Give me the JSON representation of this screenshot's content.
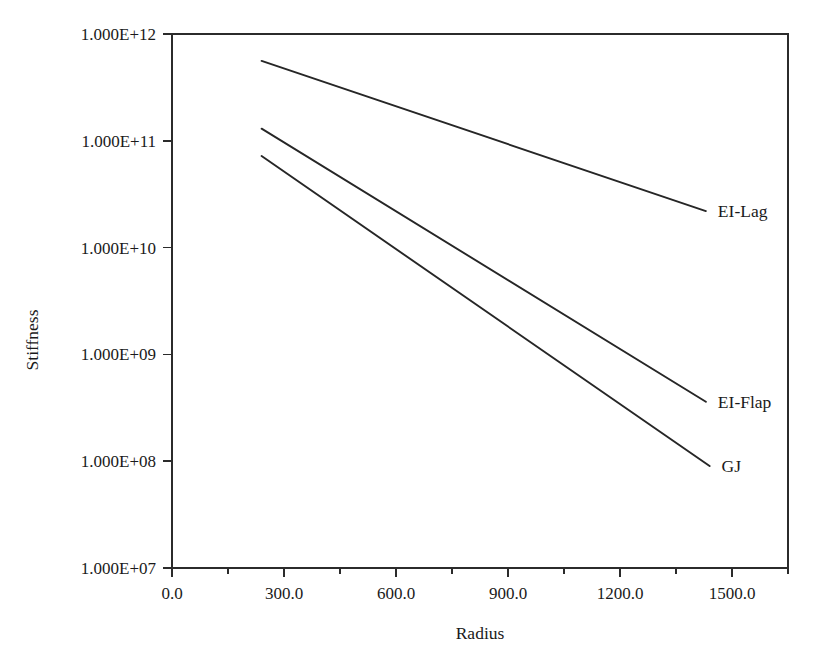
{
  "chart_data": {
    "type": "line",
    "title": "",
    "xlabel": "Radius",
    "ylabel": "Stiffness",
    "xlim": [
      0.0,
      1650.0
    ],
    "ylim": [
      10000000,
      1000000000000
    ],
    "yscale": "log",
    "xscale": "linear",
    "grid": false,
    "legend_position": "inline-right-of-line-ends",
    "x_ticks": [
      "0.0",
      "300.0",
      "600.0",
      "900.0",
      "1200.0",
      "1500.0"
    ],
    "x_tick_values": [
      0,
      300,
      600,
      900,
      1200,
      1500
    ],
    "x_minor_tick_values": [
      150,
      450,
      750,
      1050,
      1350,
      1650
    ],
    "y_ticks": [
      "1.000E+07",
      "1.000E+08",
      "1.000E+09",
      "1.000E+10",
      "1.000E+11",
      "1.000E+12"
    ],
    "y_tick_values": [
      10000000,
      100000000,
      1000000000,
      10000000000,
      100000000000,
      1000000000000
    ],
    "series": [
      {
        "name": "EI-Lag",
        "color": "#262626",
        "x": [
          240,
          1430
        ],
        "y": [
          560000000000.0,
          22000000000.0
        ],
        "label": "EI-Lag"
      },
      {
        "name": "EI-Flap",
        "color": "#262626",
        "x": [
          240,
          1430
        ],
        "y": [
          130000000000.0,
          360000000.0
        ],
        "label": "EI-Flap"
      },
      {
        "name": "GJ",
        "color": "#262626",
        "x": [
          240,
          1440
        ],
        "y": [
          72000000000.0,
          90000000.0
        ],
        "label": "GJ"
      }
    ]
  },
  "axes": {
    "x_axis_title": "Radius",
    "y_axis_title": "Stiffness"
  }
}
